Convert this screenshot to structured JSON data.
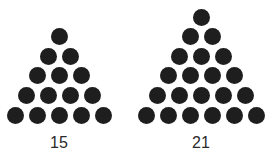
{
  "figures": [
    {
      "rows": 5,
      "count_label": "15",
      "center_x": 59,
      "bottom_y": 115
    },
    {
      "rows": 6,
      "count_label": "21",
      "center_x": 201,
      "bottom_y": 115
    }
  ],
  "dot_color": "#1e1e1e",
  "dot_spacing_x": 22,
  "dot_spacing_y": 19.6
}
